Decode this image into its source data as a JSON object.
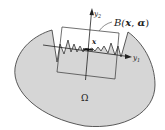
{
  "diagram": {
    "labels": {
      "domain": "Ω",
      "box": "B(",
      "box_x": "x",
      "box_sep": ", ",
      "box_alpha": "α",
      "box_close": ")",
      "point": "x",
      "axis_y1_base": "y",
      "axis_y1_sub": "1",
      "axis_y2_base": "y",
      "axis_y2_sub": "2"
    },
    "colors": {
      "domain_fill": "#d6d6d6",
      "stroke": "#333333",
      "background": "#ffffff"
    }
  }
}
